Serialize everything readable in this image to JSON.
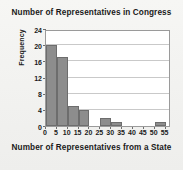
{
  "chart_data": {
    "type": "bar",
    "title": "Number of Representatives in Congress",
    "xlabel": "Number of Representatives from a State",
    "ylabel": "Frequency",
    "categories": [
      "0-5",
      "5-10",
      "10-15",
      "15-20",
      "20-25",
      "25-30",
      "30-35",
      "35-40",
      "40-45",
      "45-50",
      "50-55"
    ],
    "bin_starts": [
      0,
      5,
      10,
      15,
      20,
      25,
      30,
      35,
      40,
      45,
      50
    ],
    "bin_width": 5,
    "values": [
      20,
      17,
      5,
      4,
      0,
      2,
      1,
      0,
      0,
      0,
      1
    ],
    "xlim": [
      0,
      57.5
    ],
    "ylim": [
      0,
      24
    ],
    "x_ticks": [
      0,
      5,
      10,
      15,
      20,
      25,
      30,
      35,
      40,
      45,
      50,
      55
    ],
    "x_tick_labels": [
      "0",
      "5",
      "10",
      "15",
      "20",
      "25",
      "30",
      "35",
      "40",
      "45",
      "50",
      "55"
    ],
    "y_ticks": [
      0,
      4,
      8,
      12,
      16,
      20,
      24
    ],
    "y_tick_labels": [
      "0",
      "4",
      "8",
      "12",
      "16",
      "20",
      "24"
    ],
    "grid": "horizontal",
    "legend": null,
    "bar_color": "#8d8d8d",
    "bar_edge_color": "#6d6d6d",
    "gridline_color": "#c9c9c9",
    "plot_background": "#ffffff",
    "figure_background": "#f2f2f0",
    "text_color": "#1a1a1a"
  }
}
